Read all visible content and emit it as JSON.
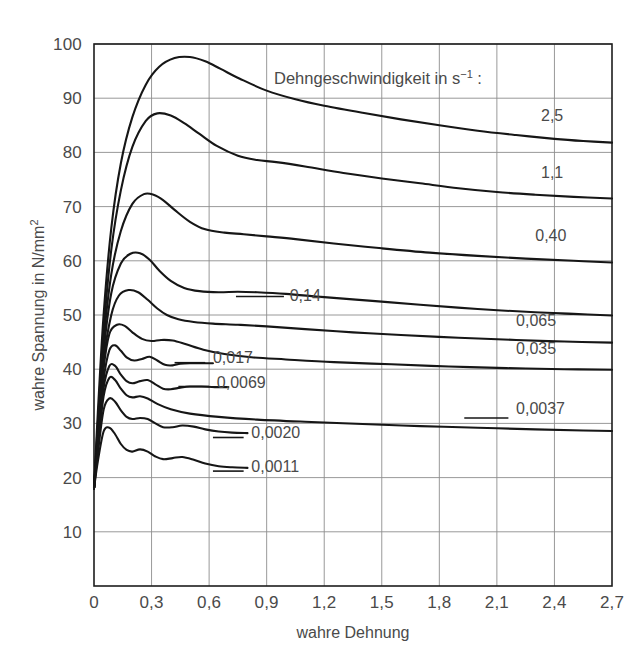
{
  "chart_data": {
    "type": "line",
    "title": "",
    "legend_title": "Dehngeschwindigkeit in s⁻¹ :",
    "xlabel": "wahre Dehnung",
    "ylabel": "wahre Spannung in N/mm²",
    "xlim": [
      0,
      2.7
    ],
    "ylim": [
      0,
      100
    ],
    "xticks": [
      0,
      0.3,
      0.6,
      0.9,
      1.2,
      1.5,
      1.8,
      2.1,
      2.4,
      2.7
    ],
    "xticklabels": [
      "0",
      "0,3",
      "0,6",
      "0,9",
      "1,2",
      "1,5",
      "1,8",
      "2,1",
      "2,4",
      "2,7"
    ],
    "yticks": [
      0,
      10,
      20,
      30,
      40,
      50,
      60,
      70,
      80,
      90,
      100
    ],
    "yticklabels": [
      "",
      "10",
      "20",
      "30",
      "40",
      "50",
      "60",
      "70",
      "80",
      "90",
      "100"
    ],
    "grid": true,
    "grid_color": "#8d8d8d",
    "axis_color": "#1d1d1d",
    "curve_color": "#161616",
    "legend_position": "inline-right-of-curves",
    "series": [
      {
        "name": "2,5",
        "label": "2,5",
        "label_x": 2.33,
        "label_y": 86.5,
        "leader": false,
        "x": [
          0.0,
          0.02,
          0.05,
          0.09,
          0.14,
          0.2,
          0.27,
          0.34,
          0.42,
          0.5,
          0.58,
          0.66,
          0.76,
          0.9,
          1.05,
          1.2,
          1.4,
          1.6,
          1.8,
          2.0,
          2.2,
          2.4,
          2.55,
          2.7
        ],
        "y": [
          18.0,
          32.0,
          50.0,
          66.0,
          78.0,
          86.5,
          92.5,
          95.8,
          97.4,
          97.6,
          96.8,
          95.4,
          93.6,
          91.4,
          89.8,
          88.6,
          87.3,
          86.1,
          85.0,
          84.0,
          83.2,
          82.5,
          82.1,
          81.8
        ]
      },
      {
        "name": "1,1",
        "label": "1,1",
        "label_x": 2.33,
        "label_y": 76.0,
        "leader": false,
        "x": [
          0.0,
          0.02,
          0.05,
          0.09,
          0.14,
          0.2,
          0.27,
          0.33,
          0.4,
          0.47,
          0.55,
          0.64,
          0.75,
          0.85,
          0.95,
          1.1,
          1.3,
          1.5,
          1.7,
          1.9,
          2.1,
          2.3,
          2.5,
          2.7
        ],
        "y": [
          18.0,
          30.0,
          47.0,
          62.0,
          73.0,
          81.0,
          85.8,
          87.2,
          86.8,
          85.4,
          83.4,
          81.2,
          79.4,
          78.6,
          78.2,
          77.4,
          76.2,
          75.2,
          74.3,
          73.4,
          72.7,
          72.2,
          71.8,
          71.5
        ]
      },
      {
        "name": "0,40",
        "label": "0,40",
        "label_x": 2.3,
        "label_y": 64.5,
        "leader": false,
        "x": [
          0.0,
          0.02,
          0.05,
          0.09,
          0.14,
          0.2,
          0.26,
          0.31,
          0.36,
          0.42,
          0.5,
          0.58,
          0.68,
          0.78,
          0.9,
          1.05,
          1.25,
          1.5,
          1.75,
          2.0,
          2.25,
          2.5,
          2.7
        ],
        "y": [
          18.0,
          29.0,
          45.0,
          57.5,
          65.5,
          70.5,
          72.3,
          72.2,
          71.2,
          69.4,
          67.2,
          65.8,
          65.2,
          64.9,
          64.5,
          64.0,
          63.2,
          62.3,
          61.5,
          60.9,
          60.4,
          60.0,
          59.7
        ]
      },
      {
        "name": "0,14",
        "label": "0,14",
        "label_x": 1.02,
        "label_y": 53.4,
        "leader": true,
        "leader_x1": 0.74,
        "leader_x2": 0.99,
        "leader_y": 53.4,
        "x": [
          0.0,
          0.02,
          0.05,
          0.09,
          0.14,
          0.19,
          0.24,
          0.29,
          0.34,
          0.4,
          0.47,
          0.55,
          0.65,
          0.75,
          0.85,
          1.0,
          1.2,
          1.45,
          1.7,
          2.0,
          2.3,
          2.5,
          2.7
        ],
        "y": [
          18.0,
          28.0,
          43.0,
          54.0,
          59.5,
          61.3,
          61.4,
          60.2,
          58.2,
          56.3,
          55.0,
          54.4,
          54.2,
          54.3,
          54.2,
          53.9,
          53.3,
          52.6,
          51.9,
          51.1,
          50.5,
          50.2,
          49.9
        ]
      },
      {
        "name": "0,065",
        "label": "0,065",
        "label_x": 2.2,
        "label_y": 48.8,
        "leader": false,
        "x": [
          0.0,
          0.02,
          0.05,
          0.09,
          0.13,
          0.18,
          0.23,
          0.28,
          0.33,
          0.38,
          0.44,
          0.52,
          0.62,
          0.75,
          0.9,
          1.1,
          1.35,
          1.6,
          1.9,
          2.2,
          2.45,
          2.7
        ],
        "y": [
          18.0,
          27.5,
          41.5,
          50.0,
          53.6,
          54.6,
          54.2,
          52.8,
          51.2,
          50.0,
          49.2,
          48.7,
          48.4,
          48.2,
          47.9,
          47.4,
          46.8,
          46.3,
          45.8,
          45.4,
          45.1,
          44.9
        ]
      },
      {
        "name": "0,035",
        "label": "0,035",
        "label_x": 2.2,
        "label_y": 43.5,
        "leader": false,
        "x": [
          0.0,
          0.02,
          0.05,
          0.08,
          0.12,
          0.16,
          0.2,
          0.25,
          0.3,
          0.35,
          0.41,
          0.48,
          0.57,
          0.68,
          0.82,
          1.0,
          1.25,
          1.55,
          1.85,
          2.15,
          2.45,
          2.7
        ],
        "y": [
          18.0,
          27.0,
          40.0,
          46.5,
          48.2,
          48.0,
          46.8,
          45.6,
          45.2,
          45.4,
          45.3,
          44.6,
          43.6,
          42.8,
          42.2,
          41.8,
          41.3,
          40.9,
          40.5,
          40.2,
          40.0,
          39.9
        ]
      },
      {
        "name": "0,017",
        "label": "0,017",
        "label_x": 0.62,
        "label_y": 42.0,
        "leader": true,
        "leader_x1": 0.42,
        "leader_x2": 0.58,
        "leader_y": 41.2,
        "x": [
          0.0,
          0.02,
          0.05,
          0.08,
          0.11,
          0.14,
          0.17,
          0.21,
          0.25,
          0.29,
          0.33,
          0.37,
          0.41,
          0.45,
          0.5,
          0.56,
          0.62
        ],
        "y": [
          18.0,
          26.5,
          38.0,
          43.5,
          44.4,
          43.4,
          42.2,
          41.6,
          41.9,
          42.3,
          41.6,
          40.8,
          40.7,
          41.0,
          41.1,
          41.1,
          41.1
        ]
      },
      {
        "name": "0,0069",
        "label": "0,0069",
        "label_x": 0.64,
        "label_y": 37.4,
        "leader": true,
        "leader_x1": 0.44,
        "leader_x2": 0.6,
        "leader_y": 36.8,
        "x": [
          0.0,
          0.02,
          0.05,
          0.08,
          0.11,
          0.14,
          0.17,
          0.2,
          0.24,
          0.28,
          0.32,
          0.36,
          0.4,
          0.45,
          0.5,
          0.56,
          0.63,
          0.7
        ],
        "y": [
          18.0,
          26.0,
          36.5,
          40.6,
          40.6,
          39.0,
          37.8,
          37.4,
          37.8,
          38.0,
          37.2,
          36.4,
          36.3,
          36.6,
          36.8,
          36.8,
          36.7,
          36.7
        ]
      },
      {
        "name": "0,0037",
        "label": "0,0037",
        "label_x": 2.2,
        "label_y": 32.6,
        "leader": true,
        "leader_x1": 1.93,
        "leader_x2": 2.16,
        "leader_y": 31.0,
        "x": [
          0.0,
          0.02,
          0.05,
          0.08,
          0.11,
          0.14,
          0.17,
          0.2,
          0.24,
          0.28,
          0.33,
          0.4,
          0.5,
          0.65,
          0.85,
          1.1,
          1.4,
          1.7,
          2.0,
          2.3,
          2.55,
          2.7
        ],
        "y": [
          18.0,
          25.5,
          35.0,
          38.4,
          38.0,
          36.4,
          35.2,
          34.8,
          35.0,
          34.6,
          33.6,
          32.6,
          31.8,
          31.2,
          30.7,
          30.3,
          29.9,
          29.5,
          29.2,
          28.9,
          28.7,
          28.6
        ]
      },
      {
        "name": "0,0020",
        "label": "0,0020",
        "label_x": 0.82,
        "label_y": 28.0,
        "leader": true,
        "leader_x1": 0.62,
        "leader_x2": 0.78,
        "leader_y": 27.4,
        "x": [
          0.0,
          0.02,
          0.05,
          0.08,
          0.11,
          0.14,
          0.17,
          0.2,
          0.24,
          0.28,
          0.32,
          0.36,
          0.41,
          0.46,
          0.52,
          0.58,
          0.65,
          0.72,
          0.8
        ],
        "y": [
          18.0,
          24.5,
          32.5,
          34.6,
          34.0,
          32.4,
          31.2,
          30.8,
          31.0,
          30.8,
          30.0,
          29.3,
          29.3,
          29.6,
          29.4,
          28.9,
          28.5,
          28.3,
          28.2
        ]
      },
      {
        "name": "0,0011",
        "label": "0,0011",
        "label_x": 0.82,
        "label_y": 21.8,
        "leader": true,
        "leader_x1": 0.62,
        "leader_x2": 0.78,
        "leader_y": 21.2,
        "x": [
          0.0,
          0.02,
          0.05,
          0.08,
          0.11,
          0.14,
          0.17,
          0.2,
          0.24,
          0.28,
          0.32,
          0.36,
          0.41,
          0.46,
          0.52,
          0.58,
          0.65,
          0.72,
          0.8
        ],
        "y": [
          18.0,
          23.0,
          28.5,
          29.2,
          28.0,
          26.2,
          25.1,
          24.8,
          25.2,
          24.8,
          23.9,
          23.4,
          23.6,
          23.8,
          23.3,
          22.6,
          22.1,
          21.9,
          21.8
        ]
      }
    ]
  }
}
